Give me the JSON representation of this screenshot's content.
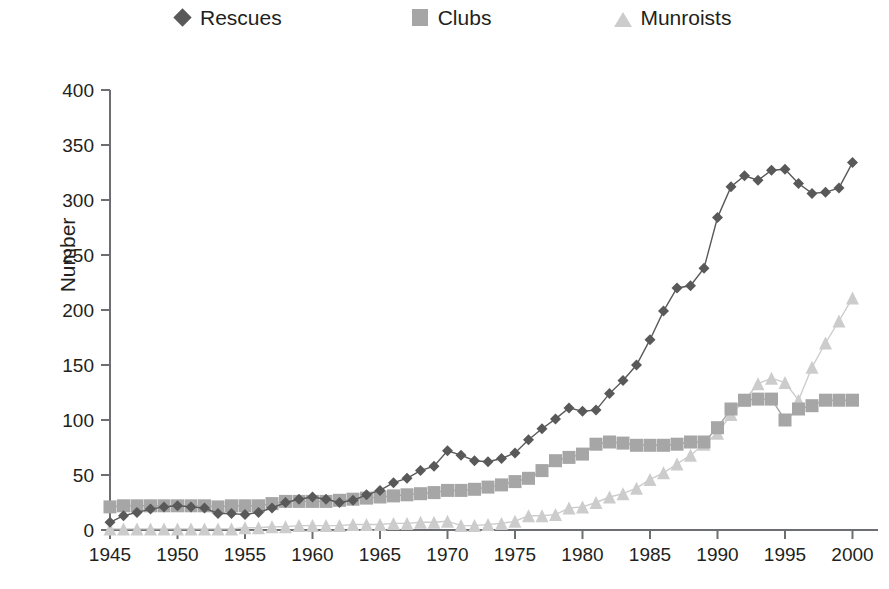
{
  "legend": {
    "entries": [
      {
        "label": "Rescues",
        "marker": "diamond-icon",
        "color": "#595959"
      },
      {
        "label": "Clubs",
        "marker": "square-icon",
        "color": "#a6a6a6"
      },
      {
        "label": "Munroists",
        "marker": "triangle-icon",
        "color": "#cccccc"
      }
    ]
  },
  "axes": {
    "ylabel": "Number",
    "xlabel": "",
    "y_ticks": [
      "0",
      "50",
      "100",
      "150",
      "200",
      "250",
      "300",
      "350",
      "400"
    ],
    "x_ticks": [
      "1945",
      "1950",
      "1955",
      "1960",
      "1965",
      "1970",
      "1975",
      "1980",
      "1985",
      "1990",
      "1995",
      "2000"
    ]
  },
  "chart_data": {
    "type": "line",
    "title": "",
    "xlabel": "",
    "ylabel": "Number",
    "xlim": [
      1945,
      2001
    ],
    "ylim": [
      0,
      400
    ],
    "grid": false,
    "legend_position": "top",
    "x": [
      1945,
      1946,
      1947,
      1948,
      1949,
      1950,
      1951,
      1952,
      1953,
      1954,
      1955,
      1956,
      1957,
      1958,
      1959,
      1960,
      1961,
      1962,
      1963,
      1964,
      1965,
      1966,
      1967,
      1968,
      1969,
      1970,
      1971,
      1972,
      1973,
      1974,
      1975,
      1976,
      1977,
      1978,
      1979,
      1980,
      1981,
      1982,
      1983,
      1984,
      1985,
      1986,
      1987,
      1988,
      1989,
      1990,
      1991,
      1992,
      1993,
      1994,
      1995,
      1996,
      1997,
      1998,
      1999,
      2000
    ],
    "series": [
      {
        "name": "Rescues",
        "color": "#595959",
        "marker": "diamond",
        "values": [
          7,
          13,
          16,
          19,
          21,
          22,
          21,
          20,
          15,
          15,
          14,
          16,
          20,
          25,
          28,
          30,
          28,
          25,
          27,
          32,
          36,
          43,
          47,
          54,
          58,
          72,
          68,
          63,
          62,
          65,
          70,
          82,
          92,
          101,
          111,
          108,
          109,
          124,
          136,
          150,
          173,
          199,
          220,
          222,
          238,
          284,
          312,
          322,
          318,
          327,
          328,
          315,
          306,
          307,
          311,
          334
        ]
      },
      {
        "name": "Clubs",
        "color": "#a6a6a6",
        "marker": "square",
        "values": [
          21,
          22,
          22,
          22,
          22,
          22,
          22,
          22,
          21,
          22,
          22,
          22,
          24,
          26,
          26,
          26,
          26,
          27,
          28,
          29,
          30,
          31,
          32,
          33,
          34,
          36,
          36,
          37,
          39,
          41,
          44,
          47,
          54,
          63,
          66,
          69,
          78,
          80,
          79,
          77,
          77,
          77,
          78,
          80,
          80,
          93,
          110,
          118,
          119,
          119,
          100,
          110,
          113,
          118,
          118,
          118
        ]
      },
      {
        "name": "Munroists",
        "color": "#cccccc",
        "marker": "triangle",
        "values": [
          1,
          1,
          1,
          1,
          1,
          1,
          1,
          1,
          1,
          1,
          2,
          2,
          3,
          3,
          4,
          4,
          4,
          4,
          5,
          5,
          5,
          6,
          6,
          7,
          7,
          8,
          4,
          4,
          5,
          6,
          8,
          13,
          13,
          14,
          20,
          21,
          25,
          30,
          33,
          38,
          46,
          52,
          60,
          68,
          78,
          88,
          105,
          118,
          133,
          138,
          134,
          118,
          148,
          170,
          190,
          211
        ]
      }
    ]
  }
}
